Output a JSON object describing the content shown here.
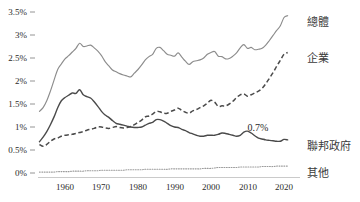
{
  "chart_data": {
    "type": "line",
    "title": "",
    "xlabel": "",
    "ylabel": "",
    "xlim": [
      1953,
      2021
    ],
    "ylim": [
      0,
      3.5
    ],
    "grid": false,
    "legend_position": "right-inline",
    "y_ticks": [
      "0%",
      "0.5%",
      "1%",
      "1.5%",
      "2%",
      "2.5%",
      "3%",
      "3.5%"
    ],
    "y_tick_values": [
      0,
      0.5,
      1,
      1.5,
      2,
      2.5,
      3,
      3.5
    ],
    "x_ticks": [
      "1960",
      "1970",
      "1980",
      "1990",
      "2000",
      "2010",
      "2020"
    ],
    "x_tick_values": [
      1960,
      1970,
      1980,
      1990,
      2000,
      2010,
      2020
    ],
    "annotations": [
      {
        "text": "0.7%",
        "x": 2010,
        "y": 0.92,
        "series": "聯邦政府"
      }
    ],
    "series": [
      {
        "name": "總體",
        "label": "總體",
        "style": "solid",
        "color": "#8c8c8c",
        "x": [
          1953,
          1954,
          1955,
          1956,
          1957,
          1958,
          1959,
          1960,
          1961,
          1962,
          1963,
          1964,
          1965,
          1966,
          1967,
          1968,
          1969,
          1970,
          1971,
          1972,
          1973,
          1974,
          1975,
          1976,
          1977,
          1978,
          1979,
          1980,
          1981,
          1982,
          1983,
          1984,
          1985,
          1986,
          1987,
          1988,
          1989,
          1990,
          1991,
          1992,
          1993,
          1994,
          1995,
          1996,
          1997,
          1998,
          1999,
          2000,
          2001,
          2002,
          2003,
          2004,
          2005,
          2006,
          2007,
          2008,
          2009,
          2010,
          2011,
          2012,
          2013,
          2014,
          2015,
          2016,
          2017,
          2018,
          2019,
          2020,
          2021
        ],
        "values": [
          1.34,
          1.42,
          1.57,
          1.78,
          2.02,
          2.25,
          2.37,
          2.48,
          2.55,
          2.63,
          2.71,
          2.82,
          2.75,
          2.76,
          2.78,
          2.72,
          2.65,
          2.55,
          2.42,
          2.33,
          2.24,
          2.2,
          2.16,
          2.13,
          2.11,
          2.09,
          2.17,
          2.25,
          2.35,
          2.46,
          2.53,
          2.58,
          2.71,
          2.73,
          2.66,
          2.58,
          2.56,
          2.54,
          2.61,
          2.52,
          2.43,
          2.36,
          2.42,
          2.44,
          2.46,
          2.5,
          2.58,
          2.62,
          2.64,
          2.54,
          2.53,
          2.48,
          2.49,
          2.54,
          2.61,
          2.72,
          2.79,
          2.71,
          2.73,
          2.68,
          2.69,
          2.71,
          2.78,
          2.88,
          2.99,
          3.1,
          3.2,
          3.38,
          3.42
        ]
      },
      {
        "name": "企業",
        "label": "企業",
        "style": "dashed",
        "color": "#4a4a4a",
        "x": [
          1953,
          1954,
          1955,
          1956,
          1957,
          1958,
          1959,
          1960,
          1961,
          1962,
          1963,
          1964,
          1965,
          1966,
          1967,
          1968,
          1969,
          1970,
          1971,
          1972,
          1973,
          1974,
          1975,
          1976,
          1977,
          1978,
          1979,
          1980,
          1981,
          1982,
          1983,
          1984,
          1985,
          1986,
          1987,
          1988,
          1989,
          1990,
          1991,
          1992,
          1993,
          1994,
          1995,
          1996,
          1997,
          1998,
          1999,
          2000,
          2001,
          2002,
          2003,
          2004,
          2005,
          2006,
          2007,
          2008,
          2009,
          2010,
          2011,
          2012,
          2013,
          2014,
          2015,
          2016,
          2017,
          2018,
          2019,
          2020,
          2021
        ],
        "values": [
          0.62,
          0.58,
          0.62,
          0.69,
          0.74,
          0.76,
          0.8,
          0.82,
          0.83,
          0.84,
          0.86,
          0.88,
          0.9,
          0.93,
          0.95,
          0.97,
          1.0,
          1.0,
          0.98,
          0.97,
          0.99,
          1.01,
          0.99,
          0.98,
          0.99,
          1.01,
          1.05,
          1.1,
          1.15,
          1.22,
          1.24,
          1.28,
          1.34,
          1.33,
          1.3,
          1.3,
          1.34,
          1.37,
          1.41,
          1.36,
          1.32,
          1.3,
          1.35,
          1.38,
          1.42,
          1.46,
          1.52,
          1.58,
          1.54,
          1.45,
          1.46,
          1.46,
          1.5,
          1.56,
          1.64,
          1.7,
          1.72,
          1.67,
          1.7,
          1.74,
          1.78,
          1.84,
          1.94,
          2.06,
          2.18,
          2.32,
          2.45,
          2.58,
          2.62
        ]
      },
      {
        "name": "聯邦政府",
        "label": "聯邦政府",
        "style": "solid",
        "color": "#4a4a4a",
        "x": [
          1953,
          1954,
          1955,
          1956,
          1957,
          1958,
          1959,
          1960,
          1961,
          1962,
          1963,
          1964,
          1965,
          1966,
          1967,
          1968,
          1969,
          1970,
          1971,
          1972,
          1973,
          1974,
          1975,
          1976,
          1977,
          1978,
          1979,
          1980,
          1981,
          1982,
          1983,
          1984,
          1985,
          1986,
          1987,
          1988,
          1989,
          1990,
          1991,
          1992,
          1993,
          1994,
          1995,
          1996,
          1997,
          1998,
          1999,
          2000,
          2001,
          2002,
          2003,
          2004,
          2005,
          2006,
          2007,
          2008,
          2009,
          2010,
          2011,
          2012,
          2013,
          2014,
          2015,
          2016,
          2017,
          2018,
          2019,
          2020,
          2021
        ],
        "values": [
          0.68,
          0.78,
          0.9,
          1.05,
          1.22,
          1.42,
          1.57,
          1.64,
          1.69,
          1.74,
          1.73,
          1.81,
          1.7,
          1.66,
          1.63,
          1.55,
          1.45,
          1.34,
          1.26,
          1.21,
          1.14,
          1.08,
          1.06,
          1.04,
          1.02,
          1.0,
          0.99,
          0.99,
          1.0,
          1.04,
          1.08,
          1.1,
          1.16,
          1.16,
          1.13,
          1.08,
          1.03,
          1.0,
          0.99,
          0.95,
          0.92,
          0.88,
          0.85,
          0.82,
          0.8,
          0.8,
          0.82,
          0.82,
          0.82,
          0.84,
          0.87,
          0.86,
          0.84,
          0.82,
          0.8,
          0.82,
          0.89,
          0.91,
          0.87,
          0.81,
          0.76,
          0.74,
          0.72,
          0.71,
          0.7,
          0.69,
          0.69,
          0.73,
          0.72
        ]
      },
      {
        "name": "其他",
        "label": "其他",
        "style": "dotted",
        "color": "#9b9b9b",
        "x": [
          1953,
          1954,
          1955,
          1956,
          1957,
          1958,
          1959,
          1960,
          1961,
          1962,
          1963,
          1964,
          1965,
          1966,
          1967,
          1968,
          1969,
          1970,
          1971,
          1972,
          1973,
          1974,
          1975,
          1976,
          1977,
          1978,
          1979,
          1980,
          1981,
          1982,
          1983,
          1984,
          1985,
          1986,
          1987,
          1988,
          1989,
          1990,
          1991,
          1992,
          1993,
          1994,
          1995,
          1996,
          1997,
          1998,
          1999,
          2000,
          2001,
          2002,
          2003,
          2004,
          2005,
          2006,
          2007,
          2008,
          2009,
          2010,
          2011,
          2012,
          2013,
          2014,
          2015,
          2016,
          2017,
          2018,
          2019,
          2020,
          2021
        ],
        "values": [
          0.02,
          0.02,
          0.02,
          0.02,
          0.02,
          0.03,
          0.03,
          0.03,
          0.03,
          0.04,
          0.04,
          0.04,
          0.04,
          0.05,
          0.05,
          0.05,
          0.05,
          0.06,
          0.06,
          0.06,
          0.06,
          0.06,
          0.06,
          0.06,
          0.07,
          0.07,
          0.07,
          0.07,
          0.07,
          0.08,
          0.08,
          0.08,
          0.08,
          0.08,
          0.08,
          0.08,
          0.09,
          0.09,
          0.09,
          0.09,
          0.09,
          0.09,
          0.09,
          0.09,
          0.09,
          0.1,
          0.1,
          0.1,
          0.11,
          0.12,
          0.12,
          0.12,
          0.12,
          0.12,
          0.12,
          0.13,
          0.13,
          0.13,
          0.13,
          0.13,
          0.13,
          0.14,
          0.14,
          0.14,
          0.14,
          0.15,
          0.15,
          0.15,
          0.15
        ]
      }
    ]
  },
  "legend": {
    "total": "總體",
    "business": "企業",
    "federal": "聯邦政府",
    "other": "其他"
  }
}
